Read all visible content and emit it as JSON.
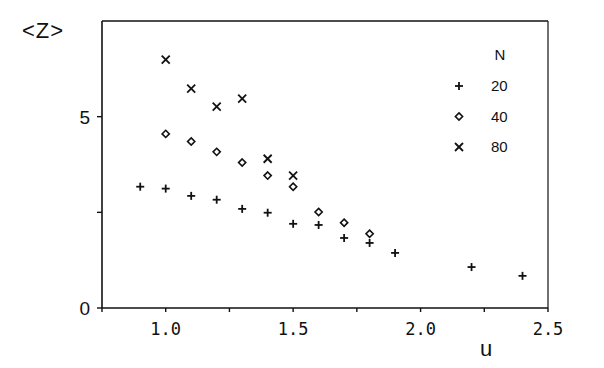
{
  "chart_data": {
    "type": "scatter",
    "title": "",
    "xlabel": "u",
    "ylabel": "<Z>",
    "xlim": [
      0.75,
      2.5
    ],
    "ylim": [
      0,
      7.5
    ],
    "x_ticks": [
      0.75,
      1.0,
      1.25,
      1.5,
      1.75,
      2.0,
      2.25,
      2.5
    ],
    "x_tick_labels": [
      "1.0",
      "1.5",
      "2.0",
      "2.5"
    ],
    "x_tick_label_values": [
      1.0,
      1.5,
      2.0,
      2.5
    ],
    "y_ticks": [
      0,
      2.5,
      5
    ],
    "y_tick_labels": [
      "0",
      "5"
    ],
    "y_tick_label_values": [
      0,
      5
    ],
    "grid": false,
    "legend": {
      "title": "N",
      "position": "upper right",
      "entries": [
        "20",
        "40",
        "80"
      ]
    },
    "series": [
      {
        "name": "20",
        "marker": "plus",
        "x": [
          0.9,
          1.0,
          1.1,
          1.2,
          1.3,
          1.4,
          1.5,
          1.6,
          1.7,
          1.8,
          1.9,
          2.2,
          2.4
        ],
        "y": [
          3.17,
          3.12,
          2.93,
          2.83,
          2.59,
          2.49,
          2.2,
          2.17,
          1.83,
          1.7,
          1.44,
          1.07,
          0.84
        ]
      },
      {
        "name": "40",
        "marker": "diamond",
        "x": [
          1.0,
          1.1,
          1.2,
          1.3,
          1.4,
          1.5,
          1.6,
          1.7,
          1.8
        ],
        "y": [
          4.55,
          4.35,
          4.08,
          3.8,
          3.46,
          3.17,
          2.51,
          2.23,
          1.94
        ]
      },
      {
        "name": "80",
        "marker": "cross",
        "x": [
          1.0,
          1.1,
          1.2,
          1.3,
          1.4,
          1.5
        ],
        "y": [
          6.49,
          5.73,
          5.26,
          5.47,
          3.9,
          3.46
        ]
      }
    ]
  },
  "labels": {
    "ylabel": "<Z>",
    "xlabel": "u"
  },
  "colors": {
    "ink": "#111111",
    "background": "#ffffff"
  }
}
